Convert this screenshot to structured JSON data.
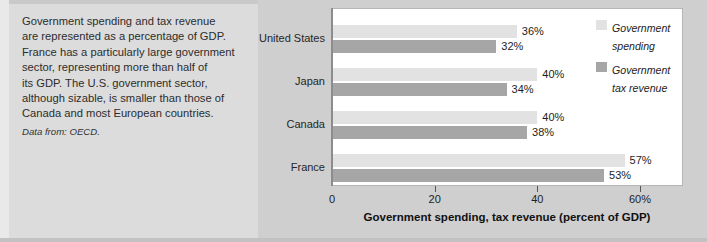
{
  "caption": {
    "body": "Government spending and tax revenue\nare represented as a percentage of GDP.\nFrance has a particularly large government\nsector, representing more than half of\nits GDP. The U.S. government sector,\nalthough sizable, is smaller than those of\nCanada and most European countries.",
    "source_label": "Data from:",
    "source_value": "OECD."
  },
  "legend": {
    "items": [
      {
        "label": "Government\nspending",
        "color": "#e2e2e2",
        "name": "legend-spending"
      },
      {
        "label": "Government\ntax revenue",
        "color": "#a6a6a6",
        "name": "legend-tax-revenue"
      }
    ]
  },
  "chart_data": {
    "type": "bar",
    "orientation": "horizontal",
    "title": "",
    "xlabel": "Government spending, tax revenue (percent of GDP)",
    "ylabel": "",
    "xlim": [
      0,
      65
    ],
    "grid": false,
    "legend_position": "right",
    "categories": [
      "United States",
      "Japan",
      "Canada",
      "France"
    ],
    "tick_labels": [
      "0",
      "20",
      "40",
      "60%"
    ],
    "tick_values": [
      0,
      20,
      40,
      60
    ],
    "series": [
      {
        "name": "Government spending",
        "color": "#e2e2e2",
        "values": [
          36,
          40,
          40,
          57
        ],
        "value_labels": [
          "36%",
          "40%",
          "40%",
          "57%"
        ]
      },
      {
        "name": "Government tax revenue",
        "color": "#a6a6a6",
        "values": [
          32,
          34,
          38,
          53
        ],
        "value_labels": [
          "32%",
          "34%",
          "38%",
          "53%"
        ]
      }
    ],
    "rows": [
      {
        "category": "United States",
        "spending": 36,
        "revenue": 32,
        "spending_label": "36%",
        "revenue_label": "32%"
      },
      {
        "category": "Japan",
        "spending": 40,
        "revenue": 34,
        "spending_label": "40%",
        "revenue_label": "34%"
      },
      {
        "category": "Canada",
        "spending": 40,
        "revenue": 38,
        "spending_label": "40%",
        "revenue_label": "38%"
      },
      {
        "category": "France",
        "spending": 57,
        "revenue": 53,
        "spending_label": "57%",
        "revenue_label": "53%"
      }
    ]
  }
}
